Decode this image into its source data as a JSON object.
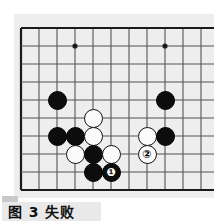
{
  "figure": {
    "caption": "图 3  失败",
    "caption_label": "图",
    "caption_number": "3",
    "caption_word": "失败",
    "background_color": "#ffffff"
  },
  "board": {
    "type": "go-board-corner",
    "board_color": "#eeeeee",
    "line_color": "#555555",
    "edge_color": "#1a1a1a",
    "grid_spacing": 18,
    "origin_x": 7,
    "origin_y": 14,
    "columns": 11,
    "rows": 10,
    "edges": {
      "left": true,
      "top": true,
      "right": false,
      "bottom": true
    },
    "star_points": [
      {
        "col": 3,
        "row": 1
      },
      {
        "col": 8,
        "row": 1
      },
      {
        "col": 8,
        "row": 6
      }
    ]
  },
  "stones": [
    {
      "id": "b1",
      "color": "black",
      "col": 2,
      "row": 4,
      "label": ""
    },
    {
      "id": "b2",
      "color": "black",
      "col": 8,
      "row": 4,
      "label": ""
    },
    {
      "id": "w1",
      "color": "white",
      "col": 4,
      "row": 5,
      "label": ""
    },
    {
      "id": "b3",
      "color": "black",
      "col": 2,
      "row": 6,
      "label": ""
    },
    {
      "id": "b4",
      "color": "black",
      "col": 3,
      "row": 6,
      "label": ""
    },
    {
      "id": "w2",
      "color": "white",
      "col": 4,
      "row": 6,
      "label": ""
    },
    {
      "id": "w3",
      "color": "white",
      "col": 7,
      "row": 6,
      "label": ""
    },
    {
      "id": "b5",
      "color": "black",
      "col": 8,
      "row": 6,
      "label": ""
    },
    {
      "id": "w4",
      "color": "white",
      "col": 3,
      "row": 7,
      "label": ""
    },
    {
      "id": "b6",
      "color": "black",
      "col": 4,
      "row": 7,
      "label": ""
    },
    {
      "id": "w5",
      "color": "white",
      "col": 5,
      "row": 7,
      "label": ""
    },
    {
      "id": "w6",
      "color": "white",
      "col": 7,
      "row": 7,
      "label": "②"
    },
    {
      "id": "b7",
      "color": "black",
      "col": 4,
      "row": 8,
      "label": ""
    },
    {
      "id": "b8",
      "color": "black",
      "col": 5,
      "row": 8,
      "label": "❶"
    }
  ],
  "colors": {
    "black_stone": "#0d0d0d",
    "white_stone": "#fbfbfb",
    "caption_bar": "#e9e9e9",
    "caption_shadow": "#c9c9c9"
  }
}
